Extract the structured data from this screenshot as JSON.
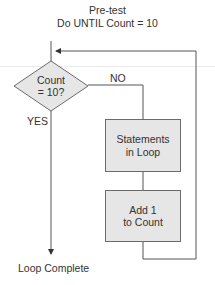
{
  "title": {
    "line1": "Pre-test",
    "line2": "Do UNTIL Count = 10"
  },
  "decision": {
    "line1": "Count",
    "line2": "= 10?",
    "no_label": "NO",
    "yes_label": "YES"
  },
  "process_boxes": [
    {
      "line1": "Statements",
      "line2": "in Loop"
    },
    {
      "line1": "Add 1",
      "line2": "to Count"
    }
  ],
  "terminal": {
    "label": "Loop Complete"
  },
  "colors": {
    "box_fill": "#e6e6e6",
    "line": "#555555",
    "text": "#333333"
  }
}
